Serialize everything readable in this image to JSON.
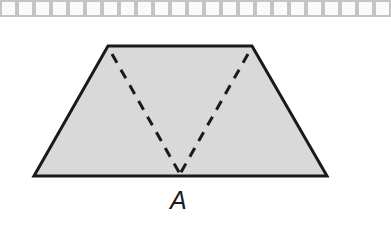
{
  "diagram": {
    "shape": "trapezoid",
    "fill_color": "#d9d9d9",
    "stroke_color": "#1a1a1a",
    "dash_color": "#1a1a1a",
    "vertices": {
      "top_left": [
        108,
        46
      ],
      "top_right": [
        252,
        46
      ],
      "bottom_right": [
        327,
        176
      ],
      "bottom_left": [
        34,
        176
      ]
    },
    "point_a": [
      180,
      176
    ],
    "dashed_segments": [
      {
        "from": "top_left",
        "to": "A"
      },
      {
        "from": "top_right",
        "to": "A"
      }
    ],
    "label_a": "A"
  },
  "grid_strip": {
    "cell_count": 23,
    "border_color": "#c4c4c4"
  }
}
